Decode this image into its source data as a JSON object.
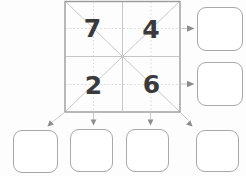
{
  "puzzle": {
    "grid": {
      "rows": 2,
      "cols": 2,
      "cells": [
        {
          "position": "top-left",
          "value": "7"
        },
        {
          "position": "top-right",
          "value": "4"
        },
        {
          "position": "bottom-left",
          "value": "2"
        },
        {
          "position": "bottom-right",
          "value": "6"
        }
      ]
    },
    "answer_boxes": [
      {
        "id": "row-1",
        "arrow": "right from top row",
        "value": ""
      },
      {
        "id": "row-2",
        "arrow": "right from bottom row",
        "value": ""
      },
      {
        "id": "diagonal-left",
        "arrow": "down-left from anti-diagonal",
        "value": ""
      },
      {
        "id": "column-1",
        "arrow": "down from left column",
        "value": ""
      },
      {
        "id": "column-2",
        "arrow": "down from right column",
        "value": ""
      },
      {
        "id": "diagonal-right",
        "arrow": "down-right from diagonal",
        "value": ""
      }
    ]
  },
  "colors": {
    "background": "#fdfdfd",
    "grid_border": "#9b9b9b",
    "center_line": "#c6c6c6",
    "dotted_line": "#d4d4d4",
    "diagonal_line": "#cacaca",
    "arrow_shaft": "#c4c4c4",
    "arrow_head": "#8c8c8c",
    "box_border": "#a8a8a8",
    "box_fill": "#ffffff",
    "number": "#3a3a3a"
  }
}
